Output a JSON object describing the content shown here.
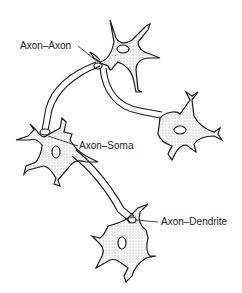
{
  "diagram": {
    "type": "neuron-synapse-types",
    "labels": {
      "axon_axon": "Axon–Axon",
      "axon_soma": "Axon–Soma",
      "axon_dendrite": "Axon–Dendrite"
    },
    "colors": {
      "stroke": "#1a1a1a",
      "fill": "#f4f4f4",
      "stipple": "#888888"
    }
  }
}
